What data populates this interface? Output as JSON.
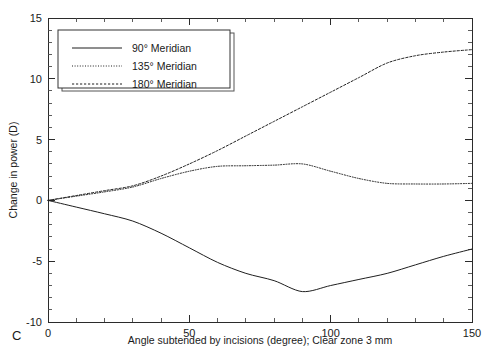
{
  "panel": {
    "letter": "C"
  },
  "chart_data": {
    "type": "line",
    "title": "",
    "subtitle": "",
    "xlabel": "Angle subtended by incisions (degree); Clear zone 3 mm",
    "ylabel": "Change in power (D)",
    "xlim": [
      0,
      150
    ],
    "ylim": [
      -10,
      15
    ],
    "x_ticks_major": [
      0,
      50,
      100,
      150
    ],
    "x_tick_labels": [
      "0",
      "50",
      "100",
      "150"
    ],
    "x_ticks_minor": [
      10,
      20,
      30,
      40,
      60,
      70,
      80,
      90,
      110,
      120,
      130,
      140
    ],
    "y_ticks_major": [
      -10,
      -5,
      0,
      5,
      10,
      15
    ],
    "y_tick_labels": [
      "-10",
      "-5",
      "0",
      "5",
      "10",
      "15"
    ],
    "y_ticks_minor": [
      -9,
      -8,
      -7,
      -6,
      -4,
      -3,
      -2,
      -1,
      1,
      2,
      3,
      4,
      6,
      7,
      8,
      9,
      11,
      12,
      13,
      14
    ],
    "grid": false,
    "legend_position": "upper-left",
    "x": [
      0,
      10,
      20,
      30,
      40,
      50,
      60,
      70,
      80,
      90,
      100,
      110,
      120,
      130,
      140,
      150
    ],
    "series": [
      {
        "name": "90° Meridian",
        "style": "solid",
        "values": [
          0,
          -0.55,
          -1.1,
          -1.7,
          -2.7,
          -3.9,
          -5.1,
          -6.0,
          -6.6,
          -7.5,
          -7.0,
          -6.5,
          -6.0,
          -5.3,
          -4.6,
          -4.0
        ]
      },
      {
        "name": "135° Meridian",
        "style": "dotted",
        "values": [
          0,
          0.35,
          0.7,
          1.1,
          1.8,
          2.4,
          2.8,
          2.85,
          2.9,
          3.0,
          2.4,
          1.8,
          1.4,
          1.35,
          1.35,
          1.4
        ]
      },
      {
        "name": "180° Meridian",
        "style": "dashed",
        "values": [
          0,
          0.4,
          0.8,
          1.2,
          2.0,
          3.0,
          4.1,
          5.3,
          6.5,
          7.7,
          8.9,
          10.1,
          11.3,
          11.9,
          12.2,
          12.4
        ]
      }
    ],
    "legend_entries": [
      {
        "label": "90° Meridian",
        "style": "solid"
      },
      {
        "label": "135° Meridian",
        "style": "dotted"
      },
      {
        "label": "180° Meridian",
        "style": "dashed"
      }
    ]
  }
}
